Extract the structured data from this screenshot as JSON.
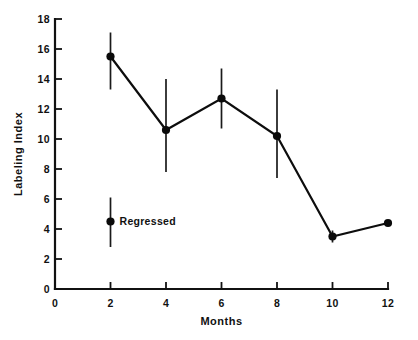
{
  "chart_data": {
    "type": "line",
    "title": "",
    "subtitle": "",
    "xlabel": "Months",
    "ylabel": "Labeling Index",
    "xlim": [
      0,
      12
    ],
    "ylim": [
      0,
      18
    ],
    "x_ticks": [
      0,
      2,
      4,
      6,
      8,
      10,
      12
    ],
    "x_tick_labels": [
      "0",
      "2",
      "4",
      "6",
      "8",
      "10",
      "12"
    ],
    "y_ticks": [
      0,
      2,
      4,
      6,
      8,
      10,
      12,
      14,
      16,
      18
    ],
    "y_tick_labels": [
      "0",
      "2",
      "4",
      "6",
      "8",
      "10",
      "12",
      "14",
      "16",
      "18"
    ],
    "grid": false,
    "legend_position": "inside-lower-left",
    "marker": "filled-circle",
    "line_color": "#0d0d0d",
    "marker_color": "#0a0a0a",
    "error_bar_color": "#1a1a1a",
    "x": [
      2,
      4,
      6,
      8,
      10,
      12
    ],
    "values": [
      15.5,
      10.6,
      12.7,
      10.2,
      3.5,
      4.4
    ],
    "error_low": [
      13.3,
      7.8,
      10.7,
      7.4,
      3.1,
      4.4
    ],
    "error_high": [
      17.1,
      14.0,
      14.7,
      13.3,
      3.9,
      4.4
    ],
    "series": [
      {
        "name": "Labeling Index",
        "x": [
          2,
          4,
          6,
          8,
          10,
          12
        ],
        "values": [
          15.5,
          10.6,
          12.7,
          10.2,
          3.5,
          4.4
        ],
        "error_low": [
          13.3,
          7.8,
          10.7,
          7.4,
          3.1,
          4.4
        ],
        "error_high": [
          17.1,
          14.0,
          14.7,
          13.3,
          3.9,
          4.4
        ]
      }
    ],
    "annotations": [
      {
        "label": "Regressed",
        "x": 2,
        "value": 4.5,
        "error_low": 2.8,
        "error_high": 6.1,
        "marker": "filled-circle"
      }
    ]
  },
  "axes": {
    "x_title": "Months",
    "y_title": "Labeling Index"
  }
}
